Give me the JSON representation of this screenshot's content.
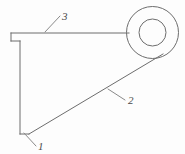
{
  "figure": {
    "kind": "technical-line-drawing",
    "background_color": "#fdfdfd",
    "line_color": "#6d6d6d",
    "leader_color": "#8a8a8a",
    "label_color": "#4a4a4a",
    "canvas": {
      "width": 185,
      "height": 154
    }
  },
  "geometry": {
    "top_edge": {
      "x1": 11,
      "y1": 33,
      "x2": 129,
      "y2": 33
    },
    "left_step_vertical": {
      "x1": 11,
      "y1": 33,
      "x2": 11,
      "y2": 41
    },
    "left_step_horizontal": {
      "x1": 11,
      "y1": 41,
      "x2": 20,
      "y2": 41
    },
    "left_edge": {
      "x1": 20,
      "y1": 41,
      "x2": 20,
      "y2": 134
    },
    "bottom_edge": {
      "x1": 20,
      "y1": 134,
      "x2": 29,
      "y2": 134
    },
    "diagonal_edge": {
      "x1": 29,
      "y1": 134,
      "x2": 163,
      "y2": 54
    },
    "ring_outer": {
      "cx": 152.5,
      "cy": 32.5,
      "r": 26
    },
    "ring_inner": {
      "cx": 152.5,
      "cy": 32.5,
      "r": 13.5
    }
  },
  "callouts": [
    {
      "id": "callout-1",
      "label": "1",
      "label_x": 38,
      "label_y": 150,
      "leader": {
        "x1": 24,
        "y1": 133,
        "x2": 36,
        "y2": 146
      }
    },
    {
      "id": "callout-2",
      "label": "2",
      "label_x": 128,
      "label_y": 104,
      "leader": {
        "x1": 108,
        "y1": 89,
        "x2": 125,
        "y2": 100
      }
    },
    {
      "id": "callout-3",
      "label": "3",
      "label_x": 62,
      "label_y": 20,
      "leader": {
        "x1": 45,
        "y1": 32,
        "x2": 60,
        "y2": 16
      }
    }
  ]
}
